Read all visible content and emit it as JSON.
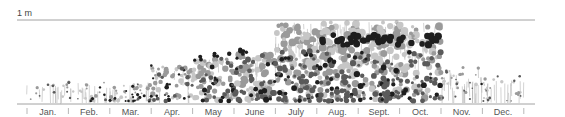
{
  "chart_data": {
    "type": "scatter",
    "title": "",
    "subtitle": "Flowering height of plants by month (illustrative dot-cloud)",
    "ylabel": "",
    "scale_label": "1 m",
    "ylim": [
      0,
      1
    ],
    "grid": false,
    "legend": null,
    "categories": [
      "Jan.",
      "Feb.",
      "Mar.",
      "Apr.",
      "May",
      "June",
      "July",
      "Aug.",
      "Sept.",
      "Oct.",
      "Nov.",
      "Dec."
    ],
    "colors": {
      "dark": "#1e1e1e",
      "mid": "#5a5a5a",
      "light": "#9a9a9a",
      "pale": "#c6c6c6",
      "stem": "#b5b5b5",
      "axis": "#8a8a8a",
      "text": "#555555"
    },
    "series": [
      {
        "month": "Jan.",
        "max_height": 0.22,
        "density": 10,
        "dark_share": 0.35,
        "size": 1.6,
        "stems": 6
      },
      {
        "month": "Feb.",
        "max_height": 0.25,
        "density": 14,
        "dark_share": 0.45,
        "size": 1.7,
        "stems": 6
      },
      {
        "month": "Mar.",
        "max_height": 0.22,
        "density": 30,
        "dark_share": 0.7,
        "size": 1.8,
        "stems": 5
      },
      {
        "month": "Apr.",
        "max_height": 0.45,
        "density": 40,
        "dark_share": 0.55,
        "size": 2.4,
        "stems": 4
      },
      {
        "month": "May",
        "max_height": 0.55,
        "density": 55,
        "dark_share": 0.45,
        "size": 2.8,
        "stems": 4
      },
      {
        "month": "June",
        "max_height": 0.6,
        "density": 70,
        "dark_share": 0.35,
        "size": 3.2,
        "stems": 8
      },
      {
        "month": "July",
        "max_height": 0.97,
        "density": 90,
        "dark_share": 0.25,
        "size": 3.3,
        "stems": 22
      },
      {
        "month": "Aug.",
        "max_height": 1.0,
        "density": 95,
        "dark_share": 0.3,
        "size": 3.4,
        "stems": 24
      },
      {
        "month": "Sept.",
        "max_height": 1.0,
        "density": 90,
        "dark_share": 0.3,
        "size": 3.3,
        "stems": 24
      },
      {
        "month": "Oct.",
        "max_height": 0.98,
        "density": 70,
        "dark_share": 0.3,
        "size": 3.2,
        "stems": 18
      },
      {
        "month": "Nov.",
        "max_height": 0.45,
        "density": 18,
        "dark_share": 0.1,
        "size": 1.6,
        "stems": 14
      },
      {
        "month": "Dec.",
        "max_height": 0.3,
        "density": 16,
        "dark_share": 0.05,
        "size": 1.5,
        "stems": 8
      }
    ],
    "highlight_band": {
      "months": [
        "Aug.",
        "Sept.",
        "Oct."
      ],
      "height_range": [
        0.7,
        0.82
      ],
      "color": "dark"
    }
  }
}
